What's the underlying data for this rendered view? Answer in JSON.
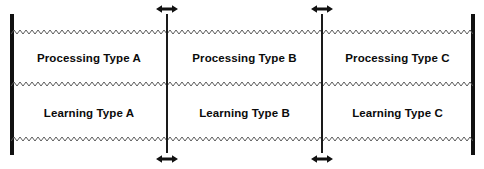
{
  "diagram": {
    "colors": {
      "ink": "#111111",
      "zigzag": "#5a5a5a",
      "background": "#ffffff"
    },
    "axis": {
      "left_cap_label": "",
      "right_cap_label": ""
    },
    "columns": [
      {
        "id": "a",
        "processing_label": "Processing Type A",
        "learning_label": "Learning Type A"
      },
      {
        "id": "b",
        "processing_label": "Processing Type B",
        "learning_label": "Learning Type B"
      },
      {
        "id": "c",
        "processing_label": "Processing Type C",
        "learning_label": "Learning Type C"
      }
    ],
    "dividers": [
      {
        "id": "divider-1",
        "adjustable": "true"
      },
      {
        "id": "divider-2",
        "adjustable": "true"
      }
    ],
    "arrows": [
      {
        "id": "arrow-top-1",
        "glyph": "double-headed-horizontal-arrow"
      },
      {
        "id": "arrow-top-2",
        "glyph": "double-headed-horizontal-arrow"
      },
      {
        "id": "arrow-bottom-1",
        "glyph": "double-headed-horizontal-arrow"
      },
      {
        "id": "arrow-bottom-2",
        "glyph": "double-headed-horizontal-arrow"
      }
    ],
    "boundary_lines": [
      {
        "id": "zigzag-top",
        "style": "zigzag"
      },
      {
        "id": "zigzag-middle",
        "style": "zigzag"
      },
      {
        "id": "zigzag-bottom",
        "style": "zigzag"
      }
    ]
  }
}
